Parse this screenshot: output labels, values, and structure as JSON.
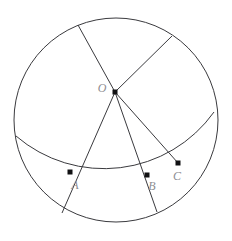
{
  "figure": {
    "background_color": "#ffffff",
    "stroke_color": "#3a3a3e",
    "dot_color": "#111113",
    "label_color": "#8d8d92",
    "width": 232,
    "height": 241
  },
  "circle": {
    "name": "main-circle",
    "cx": 116,
    "cy": 120,
    "r": 102
  },
  "arc": {
    "name": "chord-arc-abc",
    "description": "arc sweeping from left rim through A and B to C and the right rim",
    "start_x": 16,
    "start_y": 136,
    "end_x": 214,
    "end_y": 112,
    "sagitta": 44
  },
  "center_point": {
    "name": "point-o",
    "label": "O",
    "x": 115,
    "y": 92,
    "label_x": 102,
    "label_y": 92
  },
  "points": [
    {
      "name": "point-a",
      "label": "A",
      "x": 70,
      "y": 172,
      "label_x": 75,
      "label_y": 189
    },
    {
      "name": "point-b",
      "label": "B",
      "x": 147,
      "y": 175,
      "label_x": 152,
      "label_y": 190
    },
    {
      "name": "point-c",
      "label": "C",
      "x": 178,
      "y": 163,
      "label_x": 177,
      "label_y": 180
    }
  ],
  "rays": [
    {
      "name": "ray-o-to-top-left-rim",
      "from_x": 115,
      "from_y": 92,
      "to_x": 78,
      "to_y": 25
    },
    {
      "name": "ray-o-to-top-right-rim",
      "from_x": 115,
      "from_y": 92,
      "to_x": 172,
      "to_y": 36
    },
    {
      "name": "ray-o-through-a-to-rim",
      "from_x": 115,
      "from_y": 92,
      "to_x": 62,
      "to_y": 213
    },
    {
      "name": "ray-o-through-b-to-rim",
      "from_x": 115,
      "from_y": 92,
      "to_x": 157,
      "to_y": 212
    },
    {
      "name": "ray-o-to-c",
      "from_x": 115,
      "from_y": 92,
      "to_x": 178,
      "to_y": 163
    }
  ]
}
